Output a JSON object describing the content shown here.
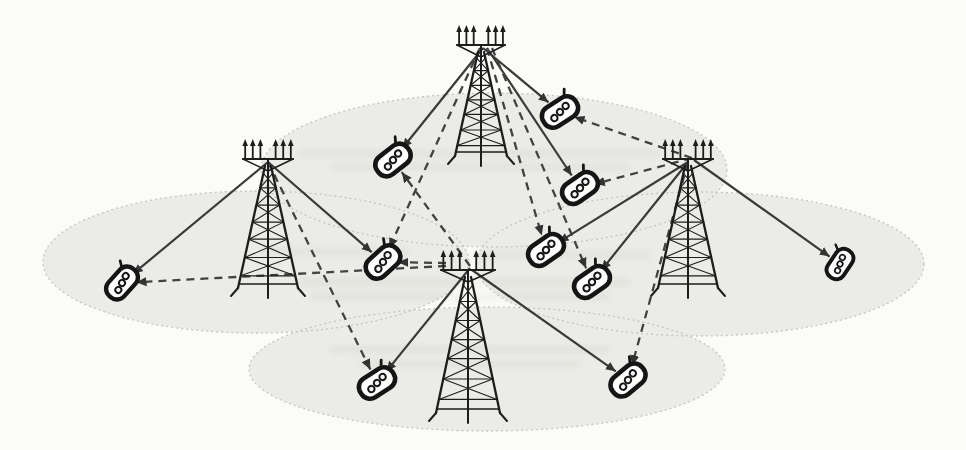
{
  "figure": {
    "background_color": "#fbfbf8",
    "canvas": {
      "width": 966,
      "height": 450
    }
  },
  "colors": {
    "cell_fill": "#ebebe7",
    "cell_border": "#c6c6c0",
    "tower": "#1d1d1d",
    "phone_outline": "#151515",
    "phone_fill": "#fdfdfc",
    "solid_link": "#3a3a3a",
    "dashed_link": "#424242",
    "arrowhead": "#333333",
    "bleed_artifact": "#a8a89e"
  },
  "cells": [
    {
      "id": "cell-top",
      "cx": 494,
      "cy": 170,
      "rx": 233,
      "ry": 77
    },
    {
      "id": "cell-left",
      "cx": 256,
      "cy": 262,
      "rx": 213,
      "ry": 71
    },
    {
      "id": "cell-right",
      "cx": 700,
      "cy": 264,
      "rx": 224,
      "ry": 72
    },
    {
      "id": "cell-bottom",
      "cx": 487,
      "cy": 369,
      "rx": 238,
      "ry": 62
    }
  ],
  "towers": [
    {
      "id": "bs-top",
      "x": 481,
      "y": 156,
      "h": 104,
      "w": 26,
      "bw": 24,
      "anchor": [
        483,
        48
      ]
    },
    {
      "id": "bs-left",
      "x": 268,
      "y": 288,
      "h": 122,
      "w": 30,
      "bw": 25,
      "anchor": [
        268,
        162
      ]
    },
    {
      "id": "bs-right",
      "x": 688,
      "y": 288,
      "h": 122,
      "w": 30,
      "bw": 25,
      "anchor": [
        688,
        162
      ]
    },
    {
      "id": "bs-center",
      "x": 468,
      "y": 413,
      "h": 136,
      "w": 32,
      "bw": 27,
      "anchor": [
        470,
        268
      ]
    }
  ],
  "phones": [
    {
      "id": "p1",
      "x": 393,
      "y": 160,
      "angle": -38,
      "scale": 1.0
    },
    {
      "id": "p2",
      "x": 560,
      "y": 112,
      "angle": -33,
      "scale": 1.0
    },
    {
      "id": "p3",
      "x": 580,
      "y": 188,
      "angle": -35,
      "scale": 1.0
    },
    {
      "id": "p4",
      "x": 122,
      "y": 283,
      "angle": -48,
      "scale": 0.95
    },
    {
      "id": "p5",
      "x": 383,
      "y": 262,
      "angle": -42,
      "scale": 1.0
    },
    {
      "id": "p6",
      "x": 546,
      "y": 250,
      "angle": -35,
      "scale": 1.0
    },
    {
      "id": "p7",
      "x": 592,
      "y": 282,
      "angle": -35,
      "scale": 1.0
    },
    {
      "id": "p8",
      "x": 840,
      "y": 264,
      "angle": -56,
      "scale": 0.85
    },
    {
      "id": "p9",
      "x": 377,
      "y": 383,
      "angle": -33,
      "scale": 1.0
    },
    {
      "id": "p10",
      "x": 628,
      "y": 380,
      "angle": -40,
      "scale": 1.0
    }
  ],
  "links": [
    {
      "from": "bs-top",
      "to": "p1",
      "style": "solid"
    },
    {
      "from": "bs-top",
      "to": "p2",
      "style": "solid"
    },
    {
      "from": "bs-top",
      "to": "p3",
      "style": "solid",
      "from_point": [
        487,
        48
      ]
    },
    {
      "from": "bs-left",
      "to": "p4",
      "style": "solid"
    },
    {
      "from": "bs-left",
      "to": "p5",
      "style": "solid"
    },
    {
      "from": "bs-right",
      "to": "p6",
      "style": "solid"
    },
    {
      "from": "bs-right",
      "to": "p7",
      "style": "solid"
    },
    {
      "from": "bs-right",
      "to": "p8",
      "style": "solid",
      "from_point": [
        694,
        160
      ]
    },
    {
      "from": "bs-center",
      "to": "p9",
      "style": "solid"
    },
    {
      "from": "bs-center",
      "to": "p10",
      "style": "solid",
      "from_point": [
        472,
        270
      ]
    },
    {
      "from": "bs-right",
      "to": "p2",
      "style": "dashed",
      "from_point": [
        692,
        158
      ]
    },
    {
      "from": "bs-right",
      "to": "p3",
      "style": "dashed",
      "from_point": [
        692,
        158
      ]
    },
    {
      "from": "bs-top",
      "to": "p5",
      "style": "dashed",
      "from_point": [
        480,
        48
      ]
    },
    {
      "from": "bs-top",
      "to": "p6",
      "style": "dashed",
      "from_point": [
        487,
        48
      ]
    },
    {
      "from": "bs-top",
      "to": "p7",
      "style": "dashed",
      "from_point": [
        492,
        48
      ]
    },
    {
      "from": "bs-center",
      "to": "p1",
      "style": "dashed",
      "from_point": [
        470,
        266
      ]
    },
    {
      "from": "bs-center",
      "to": "p5",
      "style": "dashed",
      "from_point": [
        446,
        263
      ]
    },
    {
      "from": "bs-center",
      "to": "p4",
      "style": "dashed",
      "from_point": [
        446,
        266
      ]
    },
    {
      "from": "bs-left",
      "to": "p9",
      "style": "dashed"
    },
    {
      "from": "bs-right",
      "to": "p10",
      "style": "dashed"
    }
  ],
  "artifacts": [
    {
      "x": 300,
      "y": 149,
      "w": 360,
      "h": 9
    },
    {
      "x": 330,
      "y": 163,
      "w": 300,
      "h": 8
    },
    {
      "x": 260,
      "y": 247,
      "w": 150,
      "h": 9
    },
    {
      "x": 470,
      "y": 250,
      "w": 180,
      "h": 9
    },
    {
      "x": 300,
      "y": 277,
      "w": 330,
      "h": 10
    },
    {
      "x": 310,
      "y": 292,
      "w": 300,
      "h": 9
    },
    {
      "x": 330,
      "y": 345,
      "w": 280,
      "h": 9
    },
    {
      "x": 360,
      "y": 360,
      "w": 220,
      "h": 8
    }
  ]
}
